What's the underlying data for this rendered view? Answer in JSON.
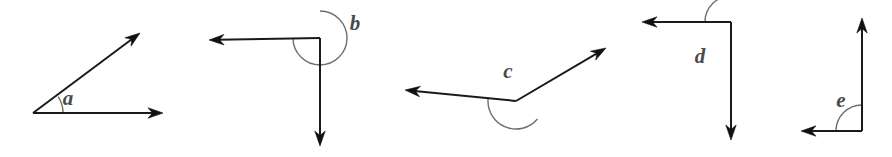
{
  "figure": {
    "background_color": "#ffffff",
    "line_color": "#1a1a1a",
    "arc_color": "#6f6f6f",
    "label_color": "#4a4a4a",
    "width": 892,
    "height": 157
  },
  "angles": [
    {
      "id": "a",
      "label": "a",
      "type": "acute",
      "label_position": {
        "x": 68,
        "y": 100
      },
      "vertex": {
        "x": 33,
        "y": 113
      },
      "arc": {
        "radius": 30,
        "start_deg": 0,
        "end_deg": 33
      },
      "rays": [
        {
          "name": "ray-a-upper",
          "to": {
            "x": 140,
            "y": 33
          },
          "arrow": true
        },
        {
          "name": "ray-a-horizontal",
          "to": {
            "x": 163,
            "y": 113
          },
          "arrow": true
        }
      ]
    },
    {
      "id": "b",
      "label": "b",
      "type": "reflex",
      "label_position": {
        "x": 355,
        "y": 25
      },
      "vertex": {
        "x": 320,
        "y": 38
      },
      "arc": {
        "radius": 27,
        "start_deg": 180,
        "end_deg": 450
      },
      "rays": [
        {
          "name": "ray-b-left",
          "to": {
            "x": 209,
            "y": 40
          },
          "arrow": true
        },
        {
          "name": "ray-b-down",
          "to": {
            "x": 320,
            "y": 146
          },
          "arrow": true
        }
      ]
    },
    {
      "id": "c",
      "label": "c",
      "type": "obtuse",
      "label_position": {
        "x": 508,
        "y": 73
      },
      "vertex": {
        "x": 516,
        "y": 101
      },
      "arc": {
        "radius": 28,
        "start_deg": 175,
        "end_deg": 320
      },
      "rays": [
        {
          "name": "ray-c-left",
          "to": {
            "x": 405,
            "y": 90
          },
          "arrow": true
        },
        {
          "name": "ray-c-upper-right",
          "to": {
            "x": 606,
            "y": 48
          },
          "arrow": true
        }
      ]
    },
    {
      "id": "d",
      "label": "d",
      "type": "right",
      "label_position": {
        "x": 700,
        "y": 58
      },
      "vertex": {
        "x": 731,
        "y": 22
      },
      "arc": {
        "radius": 26,
        "start_deg": 90,
        "end_deg": 180
      },
      "rays": [
        {
          "name": "ray-d-left",
          "to": {
            "x": 642,
            "y": 22
          },
          "arrow": true
        },
        {
          "name": "ray-d-down",
          "to": {
            "x": 731,
            "y": 140
          },
          "arrow": true
        }
      ]
    },
    {
      "id": "e",
      "label": "e",
      "type": "right",
      "label_position": {
        "x": 841,
        "y": 102
      },
      "vertex": {
        "x": 862,
        "y": 131
      },
      "arc": {
        "radius": 26,
        "start_deg": 90,
        "end_deg": 180
      },
      "rays": [
        {
          "name": "ray-e-up",
          "to": {
            "x": 862,
            "y": 18
          },
          "arrow": true
        },
        {
          "name": "ray-e-left",
          "to": {
            "x": 801,
            "y": 131
          },
          "arrow": true
        }
      ]
    }
  ]
}
